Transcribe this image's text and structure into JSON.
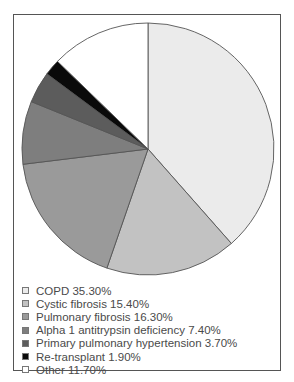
{
  "chart_data": {
    "type": "pie",
    "title": "",
    "start_angle_deg": 0,
    "direction": "clockwise",
    "legend_position": "bottom-left",
    "slices": [
      {
        "label": "COPD",
        "value": 35.3,
        "display": "COPD 35.30%",
        "color": "#ebebeb"
      },
      {
        "label": "Cystic fibrosis",
        "value": 15.4,
        "display": "Cystic fibrosis 15.40%",
        "color": "#c2c2c2"
      },
      {
        "label": "Pulmonary fibrosis",
        "value": 16.3,
        "display": "Pulmonary fibrosis 16.30%",
        "color": "#9a9a9a"
      },
      {
        "label": "Alpha 1 antitrypsin deficiency",
        "value": 7.4,
        "display": "Alpha 1 antitrypsin deficiency 7.40%",
        "color": "#7e7e7e"
      },
      {
        "label": "Primary pulmonary hypertension",
        "value": 3.7,
        "display": "Primary pulmonary hypertension 3.70%",
        "color": "#5c5c5c"
      },
      {
        "label": "Re-transplant",
        "value": 1.9,
        "display": "Re-transplant 1.90%",
        "color": "#0a0a0a"
      },
      {
        "label": "Other",
        "value": 11.7,
        "display": "Other 11.70%",
        "color": "#ffffff"
      }
    ]
  },
  "legend": {
    "items": [
      {
        "text": "COPD 35.30%"
      },
      {
        "text": "Cystic fibrosis 15.40%"
      },
      {
        "text": "Pulmonary fibrosis 16.30%"
      },
      {
        "text": "Alpha 1 antitrypsin deficiency 7.40%"
      },
      {
        "text": "Primary pulmonary hypertension 3.70%"
      },
      {
        "text": "Re-transplant 1.90%"
      },
      {
        "text": "Other 11.70%"
      }
    ]
  }
}
